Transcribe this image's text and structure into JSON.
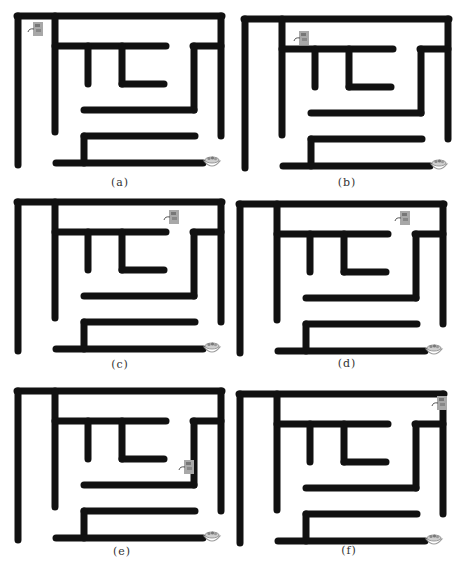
{
  "figure": {
    "wall_color": "#111111",
    "wall_width": 7,
    "mouse_color": "#a8a8a8",
    "bowl_color": "#9a9a9a",
    "walls": [
      [
        17,
        16,
        222,
        16
      ],
      [
        18,
        16,
        18,
        165
      ],
      [
        55,
        16,
        55,
        132
      ],
      [
        55,
        46,
        166,
        46
      ],
      [
        88,
        46,
        88,
        84
      ],
      [
        122,
        46,
        122,
        84
      ],
      [
        122,
        84,
        164,
        84
      ],
      [
        221,
        16,
        221,
        136
      ],
      [
        193,
        46,
        221,
        46
      ],
      [
        194,
        46,
        194,
        110
      ],
      [
        84,
        110,
        194,
        110
      ],
      [
        84,
        136,
        195,
        136
      ],
      [
        84,
        136,
        84,
        163
      ],
      [
        56,
        163,
        203,
        163
      ]
    ],
    "bowl_pos": [
      204,
      155
    ],
    "panels": [
      {
        "id": "a",
        "label": "(a)",
        "offset": [
          0,
          0
        ],
        "mouse": [
          28,
          22
        ],
        "label_pos": [
          100,
          176
        ]
      },
      {
        "id": "b",
        "label": "(b)",
        "offset": [
          227,
          3
        ],
        "mouse": [
          67,
          28
        ],
        "label_pos": [
          100,
          173
        ]
      },
      {
        "id": "c",
        "label": "(c)",
        "offset": [
          0,
          186
        ],
        "mouse": [
          164,
          24
        ],
        "label_pos": [
          100,
          172
        ]
      },
      {
        "id": "d",
        "label": "(d)",
        "offset": [
          222,
          188
        ],
        "mouse": [
          173,
          23
        ],
        "label_pos": [
          105,
          169
        ]
      },
      {
        "id": "e",
        "label": "(e)",
        "offset": [
          0,
          375
        ],
        "mouse": [
          179,
          85
        ],
        "label_pos": [
          102,
          170
        ]
      },
      {
        "id": "f",
        "label": "(f)",
        "offset": [
          222,
          378
        ],
        "mouse": [
          210,
          18
        ],
        "label_pos": [
          107,
          166
        ]
      }
    ]
  }
}
